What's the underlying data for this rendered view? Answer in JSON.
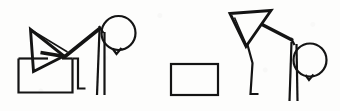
{
  "image": {
    "title": "Two stick figures with geometric heads and a rectangle",
    "kind": "line-drawing",
    "width": 340,
    "height": 111,
    "background_color": "#fdfdfc",
    "ink_color": "#141414",
    "style": "hand-drawn monochrome line art, scanned"
  },
  "scene": {
    "element_count": 3,
    "elements": [
      {
        "id": "figure-left",
        "label": "left stick figure bending over a box",
        "parts": [
          {
            "id": "left-figure-box",
            "shape": "rectangle",
            "label": "open-topped box / crate"
          },
          {
            "id": "left-figure-arrow-head",
            "shape": "triangle",
            "label": "right-pointing triangle head"
          },
          {
            "id": "left-figure-arm",
            "shape": "polyline",
            "label": "arm / reaching line"
          },
          {
            "id": "left-figure-head-circle",
            "shape": "circle",
            "label": "round head"
          },
          {
            "id": "left-figure-chin",
            "shape": "polyline",
            "label": "chin notch"
          },
          {
            "id": "left-figure-leg-front",
            "shape": "line",
            "label": "front leg"
          },
          {
            "id": "left-figure-leg-back",
            "shape": "line",
            "label": "back leg"
          },
          {
            "id": "left-figure-foot",
            "shape": "polyline",
            "label": "bent foot"
          }
        ]
      },
      {
        "id": "standalone-rectangle",
        "label": "empty rectangle",
        "shape": "rectangle"
      },
      {
        "id": "figure-right",
        "label": "right stick figure with downward triangle head",
        "parts": [
          {
            "id": "right-figure-triangle-head",
            "shape": "triangle",
            "label": "downward-pointing triangle head"
          },
          {
            "id": "right-figure-arm",
            "shape": "polyline",
            "label": "arm / reaching line"
          },
          {
            "id": "right-figure-body",
            "shape": "polyline",
            "label": "body / torso line"
          },
          {
            "id": "right-figure-head-circle",
            "shape": "circle",
            "label": "round head"
          },
          {
            "id": "right-figure-chin",
            "shape": "polyline",
            "label": "chin notch"
          },
          {
            "id": "right-figure-leg-front",
            "shape": "line",
            "label": "front leg"
          },
          {
            "id": "right-figure-leg-back",
            "shape": "line",
            "label": "back leg"
          },
          {
            "id": "right-figure-foot",
            "shape": "polyline",
            "label": "bent foot"
          }
        ]
      }
    ]
  },
  "annotations": {
    "visible_text": "",
    "note": "No text, labels, numbers or UI chrome appear anywhere in the image."
  }
}
